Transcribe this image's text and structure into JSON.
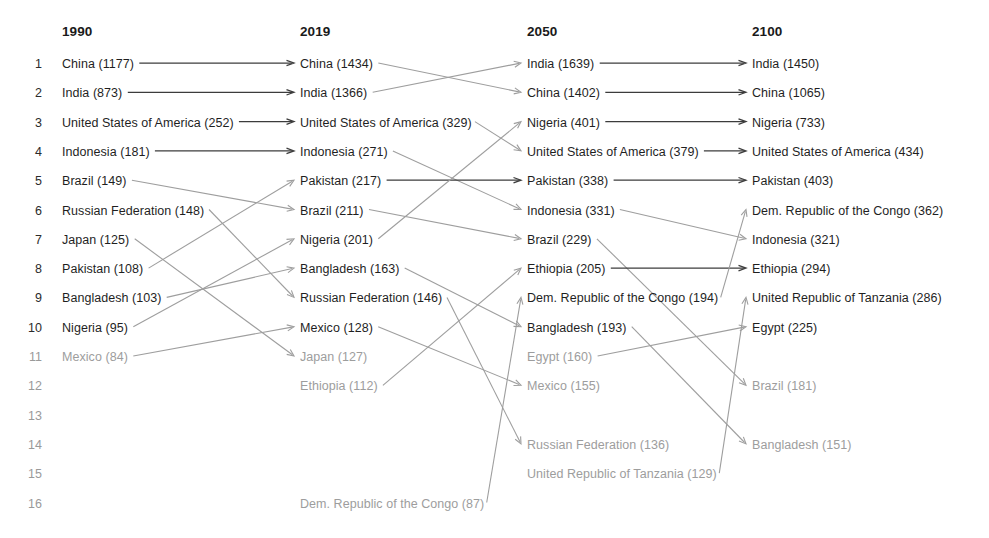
{
  "chart_data": {
    "type": "table",
    "columns": [
      "1990",
      "2019",
      "2050",
      "2100"
    ],
    "rank_labels": [
      "1",
      "2",
      "3",
      "4",
      "5",
      "6",
      "7",
      "8",
      "9",
      "10",
      "11",
      "12",
      "13",
      "14",
      "15",
      "16"
    ],
    "ranks_visible_max": 16,
    "series": [
      {
        "name": "1990",
        "entries": [
          {
            "rank": 1,
            "country": "China",
            "value": 1177,
            "label": "China (1177)",
            "dim": false
          },
          {
            "rank": 2,
            "country": "India",
            "value": 873,
            "label": "India (873)",
            "dim": false
          },
          {
            "rank": 3,
            "country": "United States of America",
            "value": 252,
            "label": "United States of America (252)",
            "dim": false
          },
          {
            "rank": 4,
            "country": "Indonesia",
            "value": 181,
            "label": "Indonesia (181)",
            "dim": false
          },
          {
            "rank": 5,
            "country": "Brazil",
            "value": 149,
            "label": "Brazil (149)",
            "dim": false
          },
          {
            "rank": 6,
            "country": "Russian Federation",
            "value": 148,
            "label": "Russian Federation (148)",
            "dim": false
          },
          {
            "rank": 7,
            "country": "Japan",
            "value": 125,
            "label": "Japan (125)",
            "dim": false
          },
          {
            "rank": 8,
            "country": "Pakistan",
            "value": 108,
            "label": "Pakistan (108)",
            "dim": false
          },
          {
            "rank": 9,
            "country": "Bangladesh",
            "value": 103,
            "label": "Bangladesh (103)",
            "dim": false
          },
          {
            "rank": 10,
            "country": "Nigeria",
            "value": 95,
            "label": "Nigeria (95)",
            "dim": false
          },
          {
            "rank": 11,
            "country": "Mexico",
            "value": 84,
            "label": "Mexico (84)",
            "dim": true
          }
        ]
      },
      {
        "name": "2019",
        "entries": [
          {
            "rank": 1,
            "country": "China",
            "value": 1434,
            "label": "China (1434)",
            "dim": false
          },
          {
            "rank": 2,
            "country": "India",
            "value": 1366,
            "label": "India (1366)",
            "dim": false
          },
          {
            "rank": 3,
            "country": "United States of America",
            "value": 329,
            "label": "United States of America (329)",
            "dim": false
          },
          {
            "rank": 4,
            "country": "Indonesia",
            "value": 271,
            "label": "Indonesia (271)",
            "dim": false
          },
          {
            "rank": 5,
            "country": "Pakistan",
            "value": 217,
            "label": "Pakistan (217)",
            "dim": false
          },
          {
            "rank": 6,
            "country": "Brazil",
            "value": 211,
            "label": "Brazil (211)",
            "dim": false
          },
          {
            "rank": 7,
            "country": "Nigeria",
            "value": 201,
            "label": "Nigeria (201)",
            "dim": false
          },
          {
            "rank": 8,
            "country": "Bangladesh",
            "value": 163,
            "label": "Bangladesh (163)",
            "dim": false
          },
          {
            "rank": 9,
            "country": "Russian Federation",
            "value": 146,
            "label": "Russian Federation (146)",
            "dim": false
          },
          {
            "rank": 10,
            "country": "Mexico",
            "value": 128,
            "label": "Mexico (128)",
            "dim": false
          },
          {
            "rank": 11,
            "country": "Japan",
            "value": 127,
            "label": "Japan (127)",
            "dim": true
          },
          {
            "rank": 12,
            "country": "Ethiopia",
            "value": 112,
            "label": "Ethiopia (112)",
            "dim": true
          },
          {
            "rank": 16,
            "country": "Dem. Republic of the Congo",
            "value": 87,
            "label": "Dem. Republic of the Congo (87)",
            "dim": true
          }
        ]
      },
      {
        "name": "2050",
        "entries": [
          {
            "rank": 1,
            "country": "India",
            "value": 1639,
            "label": "India (1639)",
            "dim": false
          },
          {
            "rank": 2,
            "country": "China",
            "value": 1402,
            "label": "China (1402)",
            "dim": false
          },
          {
            "rank": 3,
            "country": "Nigeria",
            "value": 401,
            "label": "Nigeria (401)",
            "dim": false
          },
          {
            "rank": 4,
            "country": "United States of America",
            "value": 379,
            "label": "United States of America (379)",
            "dim": false
          },
          {
            "rank": 5,
            "country": "Pakistan",
            "value": 338,
            "label": "Pakistan (338)",
            "dim": false
          },
          {
            "rank": 6,
            "country": "Indonesia",
            "value": 331,
            "label": "Indonesia (331)",
            "dim": false
          },
          {
            "rank": 7,
            "country": "Brazil",
            "value": 229,
            "label": "Brazil (229)",
            "dim": false
          },
          {
            "rank": 8,
            "country": "Ethiopia",
            "value": 205,
            "label": "Ethiopia (205)",
            "dim": false
          },
          {
            "rank": 9,
            "country": "Dem. Republic of the Congo",
            "value": 194,
            "label": "Dem. Republic of the Congo (194)",
            "dim": false
          },
          {
            "rank": 10,
            "country": "Bangladesh",
            "value": 193,
            "label": "Bangladesh (193)",
            "dim": false
          },
          {
            "rank": 11,
            "country": "Egypt",
            "value": 160,
            "label": "Egypt (160)",
            "dim": true
          },
          {
            "rank": 12,
            "country": "Mexico",
            "value": 155,
            "label": "Mexico (155)",
            "dim": true
          },
          {
            "rank": 14,
            "country": "Russian Federation",
            "value": 136,
            "label": "Russian Federation (136)",
            "dim": true
          },
          {
            "rank": 15,
            "country": "United Republic of Tanzania",
            "value": 129,
            "label": "United Republic of Tanzania (129)",
            "dim": true
          }
        ]
      },
      {
        "name": "2100",
        "entries": [
          {
            "rank": 1,
            "country": "India",
            "value": 1450,
            "label": "India (1450)",
            "dim": false
          },
          {
            "rank": 2,
            "country": "China",
            "value": 1065,
            "label": "China (1065)",
            "dim": false
          },
          {
            "rank": 3,
            "country": "Nigeria",
            "value": 733,
            "label": "Nigeria (733)",
            "dim": false
          },
          {
            "rank": 4,
            "country": "United States of America",
            "value": 434,
            "label": "United States of America (434)",
            "dim": false
          },
          {
            "rank": 5,
            "country": "Pakistan",
            "value": 403,
            "label": "Pakistan (403)",
            "dim": false
          },
          {
            "rank": 6,
            "country": "Dem. Republic of the Congo",
            "value": 362,
            "label": "Dem. Republic of the Congo (362)",
            "dim": false
          },
          {
            "rank": 7,
            "country": "Indonesia",
            "value": 321,
            "label": "Indonesia (321)",
            "dim": false
          },
          {
            "rank": 8,
            "country": "Ethiopia",
            "value": 294,
            "label": "Ethiopia (294)",
            "dim": false
          },
          {
            "rank": 9,
            "country": "United Republic of Tanzania",
            "value": 286,
            "label": "United Republic of Tanzania (286)",
            "dim": false
          },
          {
            "rank": 10,
            "country": "Egypt",
            "value": 225,
            "label": "Egypt (225)",
            "dim": false
          },
          {
            "rank": 12,
            "country": "Brazil",
            "value": 181,
            "label": "Brazil (181)",
            "dim": true
          },
          {
            "rank": 14,
            "country": "Bangladesh",
            "value": 151,
            "label": "Bangladesh (151)",
            "dim": true
          }
        ]
      }
    ],
    "links": [
      {
        "from_col": 0,
        "from_rank": 1,
        "to_col": 1,
        "to_rank": 1,
        "type": "same"
      },
      {
        "from_col": 0,
        "from_rank": 2,
        "to_col": 1,
        "to_rank": 2,
        "type": "same"
      },
      {
        "from_col": 0,
        "from_rank": 3,
        "to_col": 1,
        "to_rank": 3,
        "type": "same"
      },
      {
        "from_col": 0,
        "from_rank": 4,
        "to_col": 1,
        "to_rank": 4,
        "type": "same"
      },
      {
        "from_col": 0,
        "from_rank": 5,
        "to_col": 1,
        "to_rank": 6,
        "type": "cross"
      },
      {
        "from_col": 0,
        "from_rank": 6,
        "to_col": 1,
        "to_rank": 9,
        "type": "cross"
      },
      {
        "from_col": 0,
        "from_rank": 7,
        "to_col": 1,
        "to_rank": 11,
        "type": "cross"
      },
      {
        "from_col": 0,
        "from_rank": 8,
        "to_col": 1,
        "to_rank": 5,
        "type": "cross"
      },
      {
        "from_col": 0,
        "from_rank": 9,
        "to_col": 1,
        "to_rank": 8,
        "type": "cross"
      },
      {
        "from_col": 0,
        "from_rank": 10,
        "to_col": 1,
        "to_rank": 7,
        "type": "cross"
      },
      {
        "from_col": 0,
        "from_rank": 11,
        "to_col": 1,
        "to_rank": 10,
        "type": "cross"
      },
      {
        "from_col": 1,
        "from_rank": 1,
        "to_col": 2,
        "to_rank": 2,
        "type": "cross"
      },
      {
        "from_col": 1,
        "from_rank": 2,
        "to_col": 2,
        "to_rank": 1,
        "type": "cross"
      },
      {
        "from_col": 1,
        "from_rank": 3,
        "to_col": 2,
        "to_rank": 4,
        "type": "cross"
      },
      {
        "from_col": 1,
        "from_rank": 4,
        "to_col": 2,
        "to_rank": 6,
        "type": "cross"
      },
      {
        "from_col": 1,
        "from_rank": 5,
        "to_col": 2,
        "to_rank": 5,
        "type": "same"
      },
      {
        "from_col": 1,
        "from_rank": 6,
        "to_col": 2,
        "to_rank": 7,
        "type": "cross"
      },
      {
        "from_col": 1,
        "from_rank": 7,
        "to_col": 2,
        "to_rank": 3,
        "type": "cross"
      },
      {
        "from_col": 1,
        "from_rank": 8,
        "to_col": 2,
        "to_rank": 10,
        "type": "cross"
      },
      {
        "from_col": 1,
        "from_rank": 9,
        "to_col": 2,
        "to_rank": 14,
        "type": "cross"
      },
      {
        "from_col": 1,
        "from_rank": 10,
        "to_col": 2,
        "to_rank": 12,
        "type": "cross"
      },
      {
        "from_col": 1,
        "from_rank": 12,
        "to_col": 2,
        "to_rank": 8,
        "type": "cross"
      },
      {
        "from_col": 1,
        "from_rank": 16,
        "to_col": 2,
        "to_rank": 9,
        "type": "cross"
      },
      {
        "from_col": 2,
        "from_rank": 1,
        "to_col": 3,
        "to_rank": 1,
        "type": "same"
      },
      {
        "from_col": 2,
        "from_rank": 2,
        "to_col": 3,
        "to_rank": 2,
        "type": "same"
      },
      {
        "from_col": 2,
        "from_rank": 3,
        "to_col": 3,
        "to_rank": 3,
        "type": "same"
      },
      {
        "from_col": 2,
        "from_rank": 4,
        "to_col": 3,
        "to_rank": 4,
        "type": "same"
      },
      {
        "from_col": 2,
        "from_rank": 5,
        "to_col": 3,
        "to_rank": 5,
        "type": "same"
      },
      {
        "from_col": 2,
        "from_rank": 6,
        "to_col": 3,
        "to_rank": 7,
        "type": "cross"
      },
      {
        "from_col": 2,
        "from_rank": 7,
        "to_col": 3,
        "to_rank": 12,
        "type": "cross"
      },
      {
        "from_col": 2,
        "from_rank": 8,
        "to_col": 3,
        "to_rank": 8,
        "type": "same"
      },
      {
        "from_col": 2,
        "from_rank": 9,
        "to_col": 3,
        "to_rank": 6,
        "type": "cross"
      },
      {
        "from_col": 2,
        "from_rank": 10,
        "to_col": 3,
        "to_rank": 14,
        "type": "cross"
      },
      {
        "from_col": 2,
        "from_rank": 11,
        "to_col": 3,
        "to_rank": 10,
        "type": "cross"
      },
      {
        "from_col": 2,
        "from_rank": 15,
        "to_col": 3,
        "to_rank": 9,
        "type": "cross"
      }
    ],
    "colors": {
      "text": "#1f1f1f",
      "text_dim": "#9d9d9d",
      "arrow_same": "#3c3c3c",
      "arrow_cross": "#9e9e9e",
      "background": "#ffffff"
    },
    "layout": {
      "row_start_y": 66,
      "row_step": 29.3,
      "rank_col_x": 24,
      "column_x": [
        62,
        300,
        527,
        752
      ],
      "header_y": 34
    }
  }
}
